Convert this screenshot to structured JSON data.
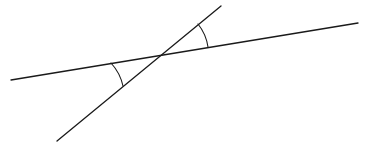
{
  "figure": {
    "type": "geometry-diagram",
    "width": 367,
    "height": 148,
    "background_color": "#ffffff",
    "stroke_color": "#1a1a1a",
    "stroke_width": 1.3,
    "arc_stroke_width": 1.1
  },
  "chart_data": {
    "type": "diagram",
    "xlabel": "",
    "ylabel": "",
    "xlim": [
      0,
      367
    ],
    "ylim": [
      0,
      148
    ],
    "grid": false,
    "legend": "none",
    "intersection_point": {
      "x": 161,
      "y": 55
    },
    "lines": [
      {
        "name": "shallow-line",
        "description": "long nearly-horizontal line rising from lower-left to upper-right",
        "x1": 11,
        "y1": 80,
        "x2": 358,
        "y2": 23,
        "slope": -0.164,
        "angle_degrees": 9.3
      },
      {
        "name": "steep-line",
        "description": "steeper line rising from lower-left to upper-right crossing the shallow line",
        "x1": 57,
        "y1": 141,
        "x2": 221,
        "y2": 6,
        "slope": -0.823,
        "angle_degrees": 39.5
      }
    ],
    "angle_arcs": [
      {
        "name": "upper-angle-arc",
        "description": "arc marking the acute angle above the intersection, between the steep line's upward ray and the shallow line's rightward ray",
        "center_x": 161,
        "center_y": 55,
        "radius": 48,
        "start_x": 198,
        "start_y": 24,
        "end_x": 208,
        "end_y": 47,
        "start_angle_degrees": 39.5,
        "end_angle_degrees": 9.3,
        "sweep_degrees": 30.2
      },
      {
        "name": "lower-angle-arc",
        "description": "arc marking the angle below-left of the intersection, between the shallow line's leftward ray and the steep line's downward ray",
        "center_x": 161,
        "center_y": 55,
        "radius": 50,
        "start_x": 111,
        "start_y": 63,
        "end_x": 123,
        "end_y": 86,
        "start_angle_degrees": 189.3,
        "end_angle_degrees": 219.5,
        "sweep_degrees": 30.2
      }
    ]
  }
}
